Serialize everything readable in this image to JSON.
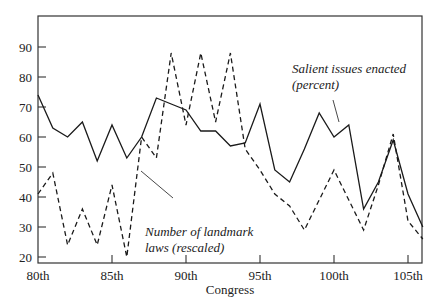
{
  "chart_data": {
    "type": "line",
    "title": "",
    "xlabel": "Congress",
    "ylabel": "",
    "x": [
      "80th",
      "81st",
      "82nd",
      "83rd",
      "84th",
      "85th",
      "86th",
      "87th",
      "88th",
      "89th",
      "90th",
      "91st",
      "92nd",
      "93rd",
      "94th",
      "95th",
      "96th",
      "97th",
      "98th",
      "99th",
      "100th",
      "101st",
      "102nd",
      "103rd",
      "104th",
      "105th",
      "106th"
    ],
    "x_tick_labels": [
      "80th",
      "85th",
      "90th",
      "95th",
      "100th",
      "105th"
    ],
    "y_ticks": [
      20,
      30,
      40,
      50,
      60,
      70,
      80,
      90
    ],
    "ylim": [
      19,
      100
    ],
    "grid": false,
    "legend": "inline annotations",
    "series": [
      {
        "name": "Salient issues enacted (percent)",
        "style": "solid",
        "values": [
          74,
          63,
          60,
          65,
          52,
          64,
          53,
          60,
          73,
          71,
          69,
          62,
          62,
          57,
          58,
          71,
          49,
          45,
          56,
          68,
          60,
          64,
          36,
          45,
          59,
          41,
          30
        ]
      },
      {
        "name": "Number of landmark laws (rescaled)",
        "style": "dashed",
        "values": [
          41,
          48,
          24,
          36,
          24,
          44,
          20,
          60,
          53,
          88,
          64,
          88,
          65,
          88,
          56,
          49,
          41,
          37,
          29,
          39,
          49,
          39,
          29,
          44,
          61,
          32,
          26
        ]
      }
    ],
    "annotations": [
      {
        "text_lines": [
          "Salient issues enacted",
          "(percent)"
        ],
        "points_to": "solid"
      },
      {
        "text_lines": [
          "Number of landmark",
          "laws (rescaled)"
        ],
        "points_to": "dashed"
      }
    ]
  },
  "colors": {
    "line": "#1a1a1a",
    "frame": "#333333",
    "background": "#ffffff"
  }
}
